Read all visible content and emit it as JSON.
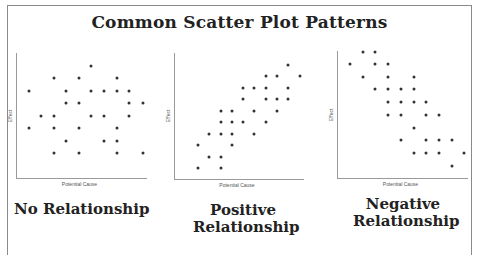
{
  "title": "Common Scatter Plot Patterns",
  "axis_labels": {
    "x": "Potential Cause",
    "y": "Effect"
  },
  "captions": {
    "none": "No Relationship",
    "positive_line1": "Positive",
    "positive_line2": "Relationship",
    "negative_line1": "Negative",
    "negative_line2": "Relationship"
  },
  "chart_data": [
    {
      "type": "scatter",
      "title": "No Relationship",
      "xlabel": "Potential Cause",
      "ylabel": "Effect",
      "grid": false,
      "axes_px": {
        "x0": 16,
        "y0": 178,
        "x1": 143,
        "ytop": 53
      },
      "points_px": [
        [
          91,
          66
        ],
        [
          54,
          78
        ],
        [
          79,
          78
        ],
        [
          117,
          78
        ],
        [
          29,
          91
        ],
        [
          66,
          91
        ],
        [
          91,
          91
        ],
        [
          104,
          91
        ],
        [
          117,
          91
        ],
        [
          129,
          91
        ],
        [
          66,
          103
        ],
        [
          79,
          103
        ],
        [
          129,
          103
        ],
        [
          143,
          103
        ],
        [
          41,
          116
        ],
        [
          54,
          116
        ],
        [
          91,
          116
        ],
        [
          104,
          116
        ],
        [
          129,
          116
        ],
        [
          29,
          128
        ],
        [
          54,
          128
        ],
        [
          79,
          128
        ],
        [
          117,
          128
        ],
        [
          66,
          141
        ],
        [
          104,
          141
        ],
        [
          117,
          141
        ],
        [
          54,
          153
        ],
        [
          79,
          153
        ],
        [
          117,
          153
        ],
        [
          143,
          153
        ]
      ]
    },
    {
      "type": "scatter",
      "title": "Positive Relationship",
      "xlabel": "Potential Cause",
      "ylabel": "Effect",
      "grid": false,
      "axes_px": {
        "x0": 174,
        "y0": 179,
        "x1": 300,
        "ytop": 53
      },
      "points_px": [
        [
          288,
          65
        ],
        [
          266,
          76
        ],
        [
          277,
          76
        ],
        [
          300,
          76
        ],
        [
          243,
          88
        ],
        [
          254,
          88
        ],
        [
          266,
          88
        ],
        [
          288,
          88
        ],
        [
          243,
          99
        ],
        [
          266,
          99
        ],
        [
          277,
          99
        ],
        [
          288,
          99
        ],
        [
          221,
          111
        ],
        [
          232,
          111
        ],
        [
          254,
          111
        ],
        [
          277,
          111
        ],
        [
          221,
          122
        ],
        [
          232,
          122
        ],
        [
          243,
          122
        ],
        [
          266,
          122
        ],
        [
          209,
          134
        ],
        [
          221,
          134
        ],
        [
          232,
          134
        ],
        [
          254,
          134
        ],
        [
          198,
          145
        ],
        [
          232,
          145
        ],
        [
          209,
          157
        ],
        [
          221,
          157
        ],
        [
          198,
          168
        ],
        [
          221,
          168
        ]
      ]
    },
    {
      "type": "scatter",
      "title": "Negative Relationship",
      "xlabel": "Potential Cause",
      "ylabel": "Effect",
      "grid": false,
      "axes_px": {
        "x0": 337,
        "y0": 178,
        "x1": 464,
        "ytop": 51
      },
      "points_px": [
        [
          363,
          52
        ],
        [
          375,
          52
        ],
        [
          350,
          64
        ],
        [
          375,
          64
        ],
        [
          388,
          64
        ],
        [
          363,
          77
        ],
        [
          388,
          77
        ],
        [
          414,
          77
        ],
        [
          375,
          89
        ],
        [
          388,
          89
        ],
        [
          401,
          89
        ],
        [
          414,
          89
        ],
        [
          388,
          102
        ],
        [
          401,
          102
        ],
        [
          414,
          102
        ],
        [
          426,
          102
        ],
        [
          388,
          115
        ],
        [
          401,
          115
        ],
        [
          426,
          115
        ],
        [
          439,
          115
        ],
        [
          414,
          128
        ],
        [
          401,
          140
        ],
        [
          426,
          140
        ],
        [
          439,
          140
        ],
        [
          452,
          140
        ],
        [
          414,
          153
        ],
        [
          426,
          153
        ],
        [
          439,
          153
        ],
        [
          464,
          153
        ],
        [
          452,
          166
        ]
      ]
    }
  ]
}
